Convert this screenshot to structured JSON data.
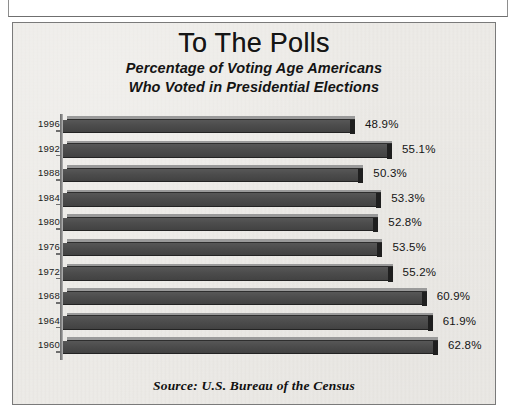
{
  "chart_data": {
    "type": "bar",
    "orientation": "horizontal",
    "title": "To The Polls",
    "subtitle_lines": [
      "Percentage of Voting Age Americans",
      "Who Voted in Presidential Elections"
    ],
    "source": "Source:  U.S. Bureau of the Census",
    "xlabel": "",
    "ylabel": "",
    "grid": false,
    "legend": false,
    "xlim": [
      0,
      62.8
    ],
    "categories": [
      "1996",
      "1992",
      "1988",
      "1984",
      "1980",
      "1976",
      "1972",
      "1968",
      "1964",
      "1960"
    ],
    "values": [
      48.9,
      55.1,
      50.3,
      53.3,
      52.8,
      53.5,
      55.2,
      60.9,
      61.9,
      62.8
    ],
    "value_labels": [
      "48.9%",
      "55.1%",
      "50.3%",
      "53.3%",
      "52.8%",
      "53.5%",
      "55.2%",
      "60.9%",
      "61.9%",
      "62.8%"
    ],
    "bars": [
      {
        "category": "1996",
        "value": 48.9,
        "label": "48.9%"
      },
      {
        "category": "1992",
        "value": 55.1,
        "label": "55.1%"
      },
      {
        "category": "1988",
        "value": 50.3,
        "label": "50.3%"
      },
      {
        "category": "1984",
        "value": 53.3,
        "label": "53.3%"
      },
      {
        "category": "1980",
        "value": 52.8,
        "label": "52.8%"
      },
      {
        "category": "1976",
        "value": 53.5,
        "label": "53.5%"
      },
      {
        "category": "1972",
        "value": 55.2,
        "label": "55.2%"
      },
      {
        "category": "1968",
        "value": 60.9,
        "label": "60.9%"
      },
      {
        "category": "1964",
        "value": 61.9,
        "label": "61.9%"
      },
      {
        "category": "1960",
        "value": 62.8,
        "label": "62.8%"
      }
    ],
    "colors": {
      "bar_face": "#4c4c4c",
      "bar_top": "#9a9a9a",
      "bar_cap": "#1f1f1f",
      "background": "#eceae6",
      "frame": "#7a7a7a",
      "text": "#141414"
    }
  }
}
